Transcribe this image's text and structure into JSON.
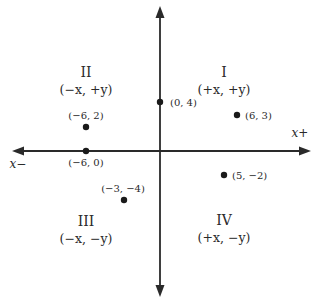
{
  "diagram": {
    "type": "coordinate-plane",
    "axes": {
      "x_positive_label": "x+",
      "x_negative_label": "x−"
    },
    "quadrants": [
      {
        "numeral": "I",
        "signs": "(+x, +y)"
      },
      {
        "numeral": "II",
        "signs": "(−x, +y)"
      },
      {
        "numeral": "III",
        "signs": "(−x, −y)"
      },
      {
        "numeral": "IV",
        "signs": "(+x, −y)"
      }
    ],
    "points": [
      {
        "x": 0,
        "y": 4,
        "label": "(0, 4)"
      },
      {
        "x": 6,
        "y": 3,
        "label": "(6, 3)"
      },
      {
        "x": -6,
        "y": 2,
        "label": "(−6, 2)"
      },
      {
        "x": -6,
        "y": 0,
        "label": "(−6, 0)"
      },
      {
        "x": 5,
        "y": -2,
        "label": "(5, −2)"
      },
      {
        "x": -3,
        "y": -4,
        "label": "(−3, −4)"
      }
    ],
    "colors": {
      "ink": "#2a2a2a",
      "background": "#ffffff"
    }
  }
}
